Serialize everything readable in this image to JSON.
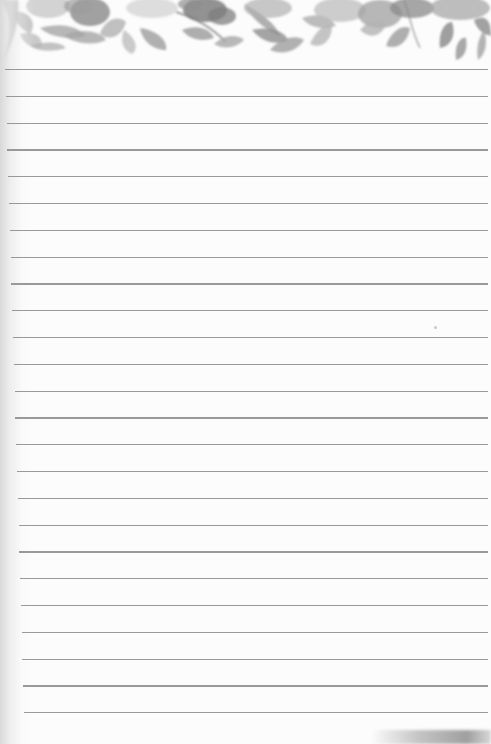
{
  "page": {
    "type": "lined-notepaper",
    "background_color": "#fcfcfc",
    "line_color": "#8e8e8e",
    "header_decoration": "watercolor-floral-border",
    "header_palette": [
      "#6f6f6f",
      "#8a8a8a",
      "#a5a5a5",
      "#c2c2c2"
    ],
    "ruled_lines": {
      "count": 25,
      "first_y": 69,
      "spacing": 26.8,
      "right_x": 488,
      "left_x_top": 5,
      "left_x_bottom": 24
    }
  }
}
